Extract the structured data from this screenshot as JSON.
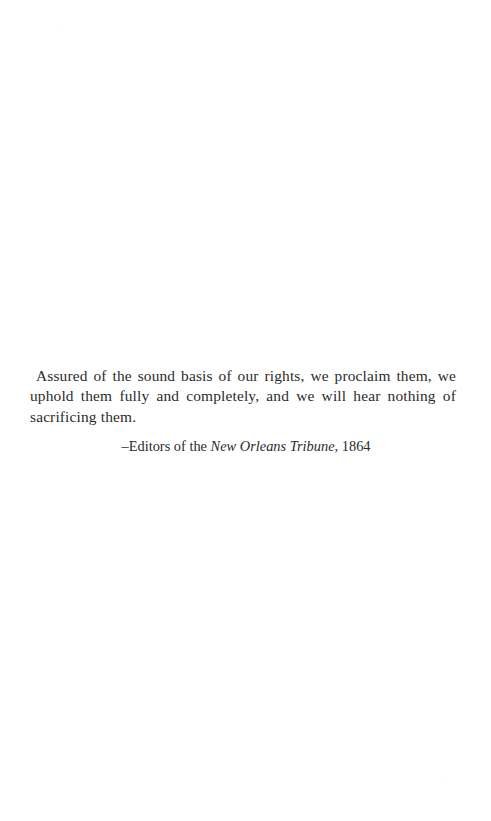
{
  "page": {
    "kind": "book-epigraph-page",
    "background_color": "#ffffff",
    "ink_color": "#2b2b2b"
  },
  "epigraph": {
    "quote": "Assured of the sound basis of our rights, we proclaim them, we uphold them fully and completely, and we will hear nothing of sacrificing them.",
    "attribution": {
      "dash": "–",
      "attributed_to": "Editors of the ",
      "source": "New Orleans Tribune",
      "separator": ",",
      "year": "1864",
      "full_text": "–Editors of the New Orleans Tribune, 1864"
    }
  }
}
